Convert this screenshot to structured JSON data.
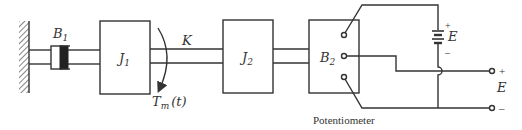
{
  "diagram": {
    "type": "mechanical-electrical schematic",
    "components": {
      "damper_left": {
        "label": "B",
        "subscript": "1"
      },
      "inertia_1": {
        "label": "J",
        "subscript": "1"
      },
      "shaft_spring": {
        "label": "K"
      },
      "torque": {
        "label": "T",
        "subscript": "m",
        "argument": "(t)"
      },
      "inertia_2": {
        "label": "J",
        "subscript": "2"
      },
      "damper_right": {
        "label": "B",
        "subscript": "2"
      },
      "battery": {
        "label": "E",
        "plus": "+",
        "minus": "–"
      },
      "output": {
        "label": "E",
        "plus": "+",
        "minus": "–"
      },
      "potentiometer": {
        "label": "Potentiometer"
      }
    },
    "colors": {
      "ink": "#333333",
      "background": "#ffffff"
    }
  }
}
